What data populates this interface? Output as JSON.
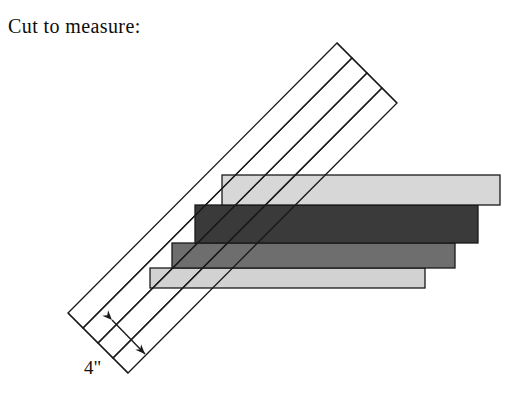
{
  "page": {
    "width": 529,
    "height": 406,
    "background_color": "#ffffff",
    "caption": "Cut to measure:"
  },
  "diagram": {
    "name": "cut-to-measure-illustration",
    "stroke_color": "#1a1a1a",
    "stroke_width": 1.3,
    "boards": [
      {
        "name": "board-1",
        "order": 1,
        "fill": "#d7d7d7",
        "left": 222,
        "right": 500,
        "top": 175,
        "bottom": 205
      },
      {
        "name": "board-2",
        "order": 2,
        "fill": "#3a3a3a",
        "left": 195,
        "right": 478,
        "top": 205,
        "bottom": 243
      },
      {
        "name": "board-3",
        "order": 3,
        "fill": "#6e6e6e",
        "left": 172,
        "right": 455,
        "top": 243,
        "bottom": 268
      },
      {
        "name": "board-4",
        "order": 4,
        "fill": "#d2d2d2",
        "left": 150,
        "right": 425,
        "top": 268,
        "bottom": 288
      }
    ],
    "diagonal_band": {
      "name": "diagonal-strip-band",
      "fill": "none",
      "strip_count": 4,
      "corner_left": {
        "x": 68,
        "y": 313
      },
      "corner_top": {
        "x": 337,
        "y": 43
      },
      "corner_right": {
        "x": 395,
        "y": 105
      },
      "corner_bottom": {
        "x": 126,
        "y": 375
      },
      "step_offset_x": 15,
      "step_offset_y": 15
    },
    "dimension": {
      "name": "strip-width-dimension",
      "label": "4\"",
      "arrow_start": {
        "x": 112,
        "y": 320
      },
      "arrow_end": {
        "x": 145,
        "y": 354
      },
      "double_headed": true
    }
  }
}
